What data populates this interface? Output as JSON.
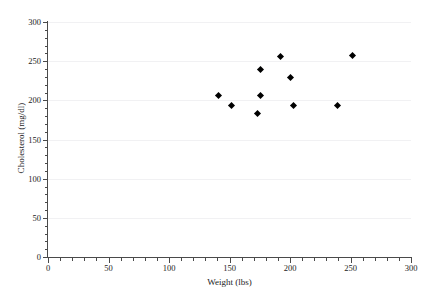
{
  "chart_data": {
    "type": "scatter",
    "title": "",
    "xlabel": "Weight (lbs)",
    "ylabel": "Cholesterol (mg/dl)",
    "xlim": [
      0,
      300
    ],
    "ylim": [
      0,
      300
    ],
    "xticks": [
      0,
      50,
      100,
      150,
      200,
      250,
      300
    ],
    "yticks": [
      0,
      50,
      100,
      150,
      200,
      250,
      300
    ],
    "xtick_labels": [
      "0",
      "50",
      "100",
      "150",
      "200",
      "250",
      "300"
    ],
    "ytick_labels": [
      "0",
      "50",
      "100",
      "150",
      "200",
      "250",
      "300"
    ],
    "x_minor_tick_step": 10,
    "y_minor_tick_step": 10,
    "grid": true,
    "grid_axis": "y",
    "grid_color": "#f1f1f3",
    "legend": false,
    "marker": "diamond",
    "marker_color": "#000000",
    "x": [
      141,
      152,
      173,
      176,
      176,
      192,
      200,
      203,
      239,
      252
    ],
    "y": [
      206,
      194,
      183,
      206,
      239,
      256,
      229,
      194,
      194,
      257
    ],
    "points": [
      {
        "weight": 141,
        "cholesterol": 206
      },
      {
        "weight": 152,
        "cholesterol": 194
      },
      {
        "weight": 173,
        "cholesterol": 183
      },
      {
        "weight": 176,
        "cholesterol": 206
      },
      {
        "weight": 176,
        "cholesterol": 239
      },
      {
        "weight": 192,
        "cholesterol": 256
      },
      {
        "weight": 200,
        "cholesterol": 229
      },
      {
        "weight": 203,
        "cholesterol": 194
      },
      {
        "weight": 239,
        "cholesterol": 194
      },
      {
        "weight": 252,
        "cholesterol": 257
      }
    ]
  }
}
